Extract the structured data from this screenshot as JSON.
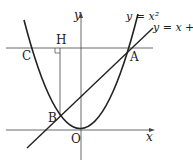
{
  "diagram": {
    "labels": {
      "y_axis": "y",
      "x_axis": "x",
      "origin": "O",
      "A": "A",
      "B": "B",
      "C": "C",
      "H": "H",
      "parabola": "y = x²",
      "line": "y = x + t"
    },
    "colors": {
      "stroke": "#222222",
      "background": "#ffffff"
    }
  }
}
